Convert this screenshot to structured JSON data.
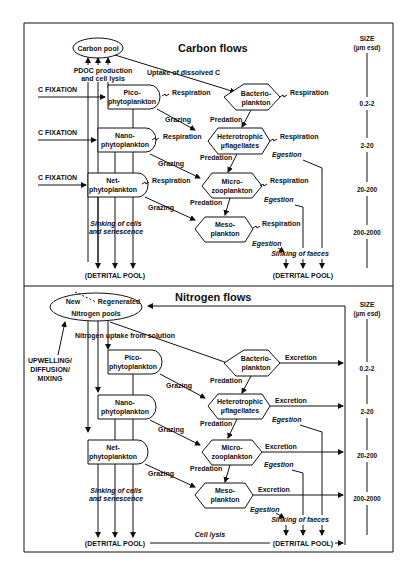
{
  "carbon": {
    "title": "Carbon flows",
    "pool": "Carbon pool",
    "pdoc_1": "PDOC production",
    "pdoc_2": "and cell lysis",
    "uptake": "Uptake of dissolved C",
    "fixation": "C FIXATION",
    "pico_1": "Pico-",
    "pico_2": "phytoplankton",
    "nano_1": "Nano-",
    "nano_2": "phytoplankton",
    "net_1": "Net-",
    "net_2": "phytoplankton",
    "bact_1": "Bacterio-",
    "bact_2": "plankton",
    "hflag_1": "Heterotrophic",
    "hflag_2": "µflagellates",
    "micro_1": "Micro-",
    "micro_2": "zooplankton",
    "meso_1": "Meso-",
    "meso_2": "plankton",
    "respiration": "Respiration",
    "grazing": "Grazing",
    "predation": "Predation",
    "egestion": "Egestion",
    "sinking_cells_1": "Sinking of cells",
    "sinking_cells_2": "and senescence",
    "sinking_faeces": "Sinking of faeces",
    "detrital": "(DETRITAL POOL)"
  },
  "nitrogen": {
    "title": "Nitrogen flows",
    "pool_new": "New",
    "pool_regen": "Regenerated",
    "pool_label": "Nitrogen pools",
    "uptake": "Nitrogen uptake from solution",
    "upwelling_1": "UPWELLING/",
    "upwelling_2": "DIFFUSION/",
    "upwelling_3": "MIXING",
    "excretion": "Excretion",
    "cell_lysis": "Cell lysis",
    "detrital": "(DETRITAL POOL)"
  },
  "size_scale": {
    "header_1": "SIZE",
    "header_2": "(µm esd)",
    "classes": [
      "0.2-2",
      "2-20",
      "20-200",
      "200-2000"
    ]
  }
}
